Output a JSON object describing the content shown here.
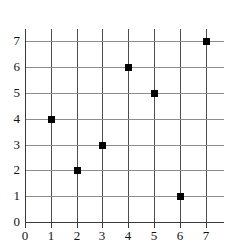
{
  "chart_data": {
    "type": "scatter",
    "title": "",
    "subtitle": "",
    "xlabel": "",
    "ylabel": "",
    "xlim": [
      0,
      7
    ],
    "ylim": [
      0,
      7
    ],
    "x_ticks": [
      "0",
      "1",
      "2",
      "3",
      "4",
      "5",
      "6",
      "7"
    ],
    "y_ticks": [
      "0",
      "1",
      "2",
      "3",
      "4",
      "5",
      "6",
      "7"
    ],
    "grid": true,
    "legend": null,
    "legend_position": "none",
    "marker": "square",
    "marker_color": "#000000",
    "grid_color_vertical": "#4d4d4d",
    "grid_color_horizontal": "#8c8c8c",
    "axis_color": "#3a3a3a",
    "background_color": "#ffffff",
    "points": [
      {
        "x": 1,
        "y": 4
      },
      {
        "x": 2,
        "y": 2
      },
      {
        "x": 3,
        "y": 3
      },
      {
        "x": 4,
        "y": 6
      },
      {
        "x": 5,
        "y": 5
      },
      {
        "x": 6,
        "y": 1
      },
      {
        "x": 7,
        "y": 7
      }
    ],
    "x": [
      1,
      2,
      3,
      4,
      5,
      6,
      7
    ],
    "values": [
      4,
      2,
      3,
      6,
      5,
      1,
      7
    ]
  }
}
